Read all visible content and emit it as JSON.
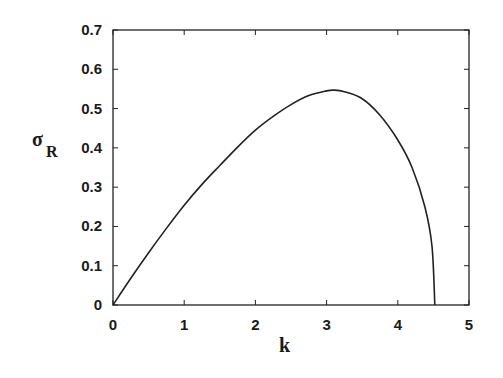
{
  "chart_data": {
    "type": "line",
    "title": "",
    "xlabel": "k",
    "ylabel": "σ",
    "ylabel_subscript": "R",
    "xlim": [
      0,
      5
    ],
    "ylim": [
      0,
      0.7
    ],
    "xticks": [
      "0",
      "1",
      "2",
      "3",
      "4",
      "5"
    ],
    "yticks": [
      "0",
      "0.1",
      "0.2",
      "0.3",
      "0.4",
      "0.5",
      "0.6",
      "0.7"
    ],
    "grid": false,
    "legend": null,
    "series": [
      {
        "name": "sigma_R(k)",
        "color": "#222222",
        "x": [
          0,
          0.25,
          0.5,
          0.75,
          1.0,
          1.25,
          1.5,
          1.75,
          2.0,
          2.25,
          2.5,
          2.75,
          3.0,
          3.1,
          3.25,
          3.5,
          3.75,
          4.0,
          4.2,
          4.38,
          4.48,
          4.52
        ],
        "y": [
          0,
          0.068,
          0.133,
          0.195,
          0.254,
          0.307,
          0.355,
          0.402,
          0.445,
          0.48,
          0.51,
          0.533,
          0.545,
          0.547,
          0.543,
          0.525,
          0.483,
          0.42,
          0.35,
          0.25,
          0.15,
          0
        ]
      }
    ]
  }
}
